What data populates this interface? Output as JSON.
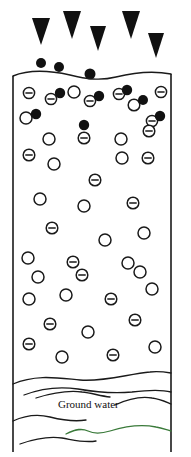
{
  "figure": {
    "background_color": "#ffffff",
    "line_color": "#1a1a1a",
    "fill_particle_color": "#111111",
    "open_particle_color": "#ffffff",
    "groundwater_accent_color": "#3a7a3a",
    "width": 191,
    "height": 457
  },
  "labels": {
    "ground_water": "Ground water"
  },
  "icons": {
    "arrow": "down-arrow-icon",
    "filled_particle": "filled-particle-icon",
    "open_particle": "open-particle-icon",
    "negative_particle": "negative-charge-particle-icon",
    "groundwater_wave": "wave-line-icon"
  },
  "column": {
    "left": 13,
    "right": 171,
    "top": 72,
    "bottom": 452,
    "top_surface_path": "M13,76 C30,69 52,71 70,75 C86,79 100,81 116,77 C132,73 150,70 171,74",
    "water_table_path": "M13,384 C36,374 58,378 80,380 C104,382 128,374 150,372 C158,371 165,372 171,373"
  },
  "arrows": [
    {
      "name": "arrow-1",
      "cx": 41,
      "top": 18,
      "half_width": 9,
      "height": 27
    },
    {
      "name": "arrow-2",
      "cx": 72,
      "top": 11,
      "half_width": 9,
      "height": 28
    },
    {
      "name": "arrow-3",
      "cx": 98,
      "top": 26,
      "half_width": 8,
      "height": 25
    },
    {
      "name": "arrow-4",
      "cx": 131,
      "top": 11,
      "half_width": 9,
      "height": 28
    },
    {
      "name": "arrow-5",
      "cx": 156,
      "top": 33,
      "half_width": 8,
      "height": 25
    }
  ],
  "surface_particles": [
    {
      "cx": 41,
      "cy": 63,
      "r": 5.0
    },
    {
      "cx": 59,
      "cy": 67,
      "r": 5.0
    },
    {
      "cx": 90,
      "cy": 74,
      "r": 5.5
    }
  ],
  "particles": [
    {
      "type": "negative",
      "cx": 29,
      "cy": 93,
      "r": 5.6
    },
    {
      "type": "negative",
      "cx": 51,
      "cy": 99,
      "r": 5.6
    },
    {
      "type": "filled",
      "cx": 60,
      "cy": 93,
      "r": 5.2
    },
    {
      "type": "open",
      "cx": 74,
      "cy": 92,
      "r": 6.0
    },
    {
      "type": "negative",
      "cx": 90,
      "cy": 101,
      "r": 5.6
    },
    {
      "type": "filled",
      "cx": 99,
      "cy": 96,
      "r": 5.2
    },
    {
      "type": "negative",
      "cx": 119,
      "cy": 94,
      "r": 5.6
    },
    {
      "type": "filled",
      "cx": 127,
      "cy": 90,
      "r": 5.2
    },
    {
      "type": "open",
      "cx": 134,
      "cy": 105,
      "r": 5.8
    },
    {
      "type": "filled",
      "cx": 143,
      "cy": 100,
      "r": 5.0
    },
    {
      "type": "negative",
      "cx": 161,
      "cy": 92,
      "r": 5.6
    },
    {
      "type": "open",
      "cx": 26,
      "cy": 118,
      "r": 6.0
    },
    {
      "type": "filled",
      "cx": 36,
      "cy": 114,
      "r": 5.2
    },
    {
      "type": "negative",
      "cx": 152,
      "cy": 121,
      "r": 5.6
    },
    {
      "type": "filled",
      "cx": 160,
      "cy": 116,
      "r": 5.2
    },
    {
      "type": "filled",
      "cx": 84,
      "cy": 125,
      "r": 5.2
    },
    {
      "type": "open",
      "cx": 49,
      "cy": 139,
      "r": 6.0
    },
    {
      "type": "negative",
      "cx": 84,
      "cy": 138,
      "r": 5.8
    },
    {
      "type": "open",
      "cx": 121,
      "cy": 139,
      "r": 6.0
    },
    {
      "type": "negative",
      "cx": 149,
      "cy": 131,
      "r": 5.8
    },
    {
      "type": "negative",
      "cx": 29,
      "cy": 155,
      "r": 5.8
    },
    {
      "type": "open",
      "cx": 54,
      "cy": 164,
      "r": 6.0
    },
    {
      "type": "open",
      "cx": 122,
      "cy": 158,
      "r": 6.0
    },
    {
      "type": "negative",
      "cx": 148,
      "cy": 158,
      "r": 5.8
    },
    {
      "type": "negative",
      "cx": 37,
      "cy": 155,
      "r": 0
    },
    {
      "type": "open",
      "cx": 55,
      "cy": 166,
      "r": 0
    },
    {
      "type": "negative",
      "cx": 29,
      "cy": 152,
      "r": 0
    },
    {
      "type": "open",
      "cx": 55,
      "cy": 165,
      "r": 0
    },
    {
      "type": "negative",
      "cx": 95,
      "cy": 180,
      "r": 5.8
    },
    {
      "type": "open",
      "cx": 122,
      "cy": 167,
      "r": 0
    },
    {
      "type": "negative",
      "cx": 161,
      "cy": 170,
      "r": 0
    },
    {
      "type": "open",
      "cx": 40,
      "cy": 199,
      "r": 6.0
    },
    {
      "type": "open",
      "cx": 84,
      "cy": 206,
      "r": 6.0
    },
    {
      "type": "negative",
      "cx": 133,
      "cy": 203,
      "r": 5.8
    },
    {
      "type": "negative",
      "cx": 52,
      "cy": 228,
      "r": 5.8
    },
    {
      "type": "open",
      "cx": 105,
      "cy": 240,
      "r": 6.0
    },
    {
      "type": "open",
      "cx": 144,
      "cy": 233,
      "r": 6.0
    },
    {
      "type": "open",
      "cx": 28,
      "cy": 258,
      "r": 6.0
    },
    {
      "type": "negative",
      "cx": 73,
      "cy": 262,
      "r": 5.8
    },
    {
      "type": "open",
      "cx": 128,
      "cy": 263,
      "r": 6.0
    },
    {
      "type": "open",
      "cx": 38,
      "cy": 277,
      "r": 6.0
    },
    {
      "type": "negative",
      "cx": 82,
      "cy": 275,
      "r": 5.8
    },
    {
      "type": "open",
      "cx": 140,
      "cy": 272,
      "r": 6.0
    },
    {
      "type": "open",
      "cx": 29,
      "cy": 299,
      "r": 6.0
    },
    {
      "type": "open",
      "cx": 66,
      "cy": 295,
      "r": 6.0
    },
    {
      "type": "negative",
      "cx": 111,
      "cy": 299,
      "r": 5.8
    },
    {
      "type": "open",
      "cx": 152,
      "cy": 289,
      "r": 6.0
    },
    {
      "type": "negative",
      "cx": 50,
      "cy": 324,
      "r": 5.8
    },
    {
      "type": "open",
      "cx": 88,
      "cy": 332,
      "r": 6.0
    },
    {
      "type": "negative",
      "cx": 135,
      "cy": 320,
      "r": 5.8
    },
    {
      "type": "negative",
      "cx": 29,
      "cy": 344,
      "r": 5.8
    },
    {
      "type": "open",
      "cx": 62,
      "cy": 357,
      "r": 6.0
    },
    {
      "type": "negative",
      "cx": 113,
      "cy": 355,
      "r": 5.8
    },
    {
      "type": "open",
      "cx": 155,
      "cy": 347,
      "r": 6.0
    }
  ],
  "groundwater_waves": [
    {
      "name": "wave-1",
      "path": "M13,384 C36,374 58,378 80,380 C104,382 128,374 150,372 C158,371 165,372 171,373",
      "accent": false
    },
    {
      "name": "wave-2",
      "path": "M24,395 C42,388 58,386 78,389 C95,392 112,394 132,392 C148,390 160,389 171,392",
      "accent": false
    },
    {
      "name": "wave-3",
      "path": "M36,398 C52,393 66,390 82,392 C92,393 100,396 110,397",
      "accent": false
    },
    {
      "name": "wave-4",
      "path": "M115,405 C128,399 140,396 152,398 C160,399 166,402 171,404",
      "accent": false
    },
    {
      "name": "wave-5",
      "path": "M13,421 C26,415 38,414 50,417 C62,420 74,422 86,420",
      "accent": false
    },
    {
      "name": "wave-6",
      "path": "M66,434 C76,429 82,428 88,431 C94,434 100,434 110,431 C126,426 142,424 156,427 C162,428 167,430 171,431",
      "accent": true
    },
    {
      "name": "wave-7",
      "path": "M20,444 C34,439 48,436 62,438 C74,440 84,443 96,441",
      "accent": false
    }
  ]
}
